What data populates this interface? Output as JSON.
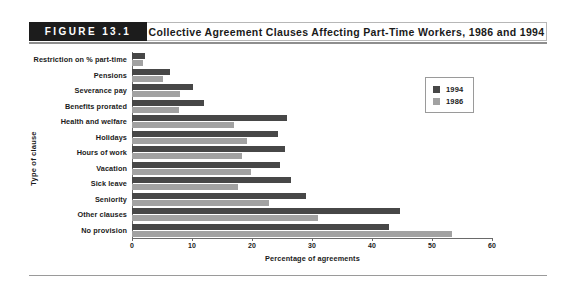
{
  "figure": {
    "number": "FIGURE 13.1",
    "title": "Collective Agreement Clauses Affecting Part-Time Workers, 1986 and 1994"
  },
  "legend": {
    "position": "top-right",
    "entries": [
      {
        "label": "1994",
        "color": "#474747"
      },
      {
        "label": "1986",
        "color": "#a2a2a2"
      }
    ]
  },
  "chart_data": {
    "type": "bar",
    "orientation": "horizontal",
    "title": "Collective Agreement Clauses Affecting Part-Time Workers, 1986 and 1994",
    "xlabel": "Percentage of agreements",
    "ylabel": "Type of clause",
    "xlim": [
      0,
      60
    ],
    "xticks": [
      0,
      10,
      20,
      30,
      40,
      50,
      60
    ],
    "xtick_labels": [
      "0",
      "10",
      "20",
      "30",
      "40",
      "50",
      "60"
    ],
    "grid": false,
    "legend_position": "top-right",
    "categories": [
      "Restriction on % part-time",
      "Pensions",
      "Severance pay",
      "Benefits prorated",
      "Health and welfare",
      "Holidays",
      "Hours of work",
      "Vacation",
      "Sick leave",
      "Seniority",
      "Other clauses",
      "No provision"
    ],
    "series": [
      {
        "name": "1994",
        "color": "#474747",
        "values": [
          2.2,
          6.3,
          10.2,
          12.0,
          25.8,
          24.3,
          25.5,
          24.7,
          26.5,
          29.0,
          44.7,
          42.8
        ]
      },
      {
        "name": "1986",
        "color": "#a2a2a2",
        "values": [
          1.8,
          5.2,
          8.0,
          7.8,
          17.0,
          19.2,
          18.3,
          19.8,
          17.7,
          22.8,
          31.0,
          53.3
        ]
      }
    ]
  }
}
